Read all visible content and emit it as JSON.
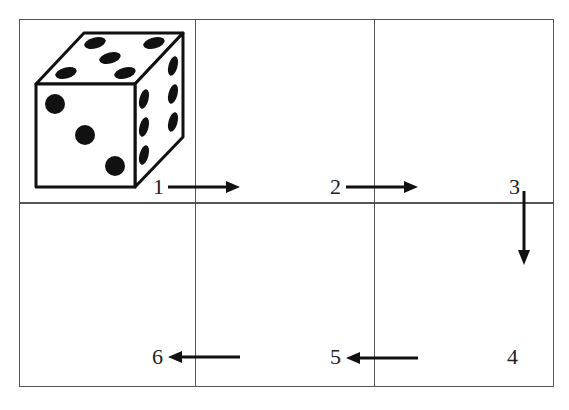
{
  "diagram": {
    "type": "dice-roll-sequence-grid",
    "grid": {
      "rows": 2,
      "cols": 3
    },
    "die": {
      "top_face_pips": 5,
      "front_face_pips": 3,
      "right_face_pips": 6
    },
    "steps": [
      {
        "label": "1",
        "direction": "right"
      },
      {
        "label": "2",
        "direction": "right"
      },
      {
        "label": "3",
        "direction": "down"
      },
      {
        "label": "4",
        "direction": "none"
      },
      {
        "label": "5",
        "direction": "left"
      },
      {
        "label": "6",
        "direction": "left"
      }
    ],
    "colors": {
      "line": "#555555",
      "ink": "#111111",
      "background": "#ffffff"
    }
  }
}
